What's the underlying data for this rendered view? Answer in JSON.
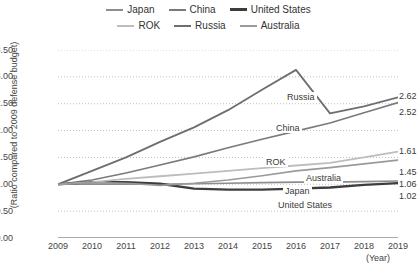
{
  "chart_data": {
    "type": "line",
    "title": "",
    "xlabel": "(Year)",
    "ylabel": "(Ratio compared to 2009 defense budget)",
    "x": [
      2009,
      2010,
      2011,
      2012,
      2013,
      2014,
      2015,
      2016,
      2017,
      2018,
      2019
    ],
    "xtick_labels": [
      "2009",
      "2010",
      "2011",
      "2012",
      "2013",
      "2014",
      "2015",
      "2016",
      "2017",
      "2018",
      "2019"
    ],
    "ytick_labels": [
      "0.00",
      "0.50",
      "1.00",
      "1.50",
      "2.00",
      "2.50",
      "3.00",
      "3.50"
    ],
    "ytick_values": [
      0.0,
      0.5,
      1.0,
      1.5,
      2.0,
      2.5,
      3.0,
      3.5
    ],
    "ylim": [
      0.0,
      3.5
    ],
    "grid": "horizontal-dotted",
    "legend_position": "top-center",
    "series": [
      {
        "name": "Japan",
        "color": "#8d8d8d",
        "width": 1.6,
        "values": [
          1.0,
          1.0,
          1.0,
          1.0,
          1.01,
          1.02,
          1.03,
          1.04,
          1.04,
          1.05,
          1.06
        ],
        "end_label": "1.06",
        "inline_label": "Japan"
      },
      {
        "name": "China",
        "color": "#7a7a7a",
        "width": 1.6,
        "values": [
          1.0,
          1.08,
          1.21,
          1.36,
          1.51,
          1.68,
          1.84,
          1.99,
          2.14,
          2.33,
          2.52
        ],
        "end_label": "2.52",
        "inline_label": "China"
      },
      {
        "name": "United States",
        "color": "#3d3d3d",
        "width": 2.3,
        "values": [
          1.0,
          1.04,
          1.04,
          1.01,
          0.92,
          0.9,
          0.9,
          0.92,
          0.94,
          0.99,
          1.02
        ],
        "end_label": "1.02",
        "inline_label": "United States"
      },
      {
        "name": "ROK",
        "color": "#bdbdbd",
        "width": 1.8,
        "values": [
          1.0,
          1.04,
          1.1,
          1.15,
          1.2,
          1.25,
          1.3,
          1.35,
          1.4,
          1.5,
          1.61
        ],
        "end_label": "1.61",
        "inline_label": "ROK"
      },
      {
        "name": "Russia",
        "color": "#6e6e6e",
        "width": 1.8,
        "values": [
          1.0,
          1.25,
          1.5,
          1.79,
          2.06,
          2.38,
          2.76,
          3.13,
          2.32,
          2.45,
          2.62
        ],
        "end_label": "2.62",
        "inline_label": "Russia"
      },
      {
        "name": "Australia",
        "color": "#9a9a9a",
        "width": 1.6,
        "values": [
          1.0,
          1.03,
          1.02,
          0.98,
          1.02,
          1.08,
          1.16,
          1.25,
          1.31,
          1.38,
          1.45
        ],
        "end_label": "1.45",
        "inline_label": "Australia"
      }
    ],
    "inline_annotations": [
      {
        "text": "Russia",
        "x_px": 285,
        "y_px": 92
      },
      {
        "text": "China",
        "x_px": 274,
        "y_px": 123
      },
      {
        "text": "ROK",
        "x_px": 264,
        "y_px": 157
      },
      {
        "text": "Australia",
        "x_px": 304,
        "y_px": 173
      },
      {
        "text": "Japan",
        "x_px": 283,
        "y_px": 186
      },
      {
        "text": "United States",
        "x_px": 276,
        "y_px": 200
      }
    ],
    "end_labels": [
      {
        "text": "2.62",
        "y_px": 91
      },
      {
        "text": "2.52",
        "y_px": 107
      },
      {
        "text": "1.61",
        "y_px": 146
      },
      {
        "text": "1.45",
        "y_px": 167
      },
      {
        "text": "1.06",
        "y_px": 179
      },
      {
        "text": "1.02",
        "y_px": 191
      }
    ]
  },
  "legend": {
    "rows": [
      [
        {
          "label": "Japan",
          "color": "#8d8d8d",
          "width": 2
        },
        {
          "label": "China",
          "color": "#7a7a7a",
          "width": 2
        },
        {
          "label": "United States",
          "color": "#3d3d3d",
          "width": 3
        }
      ],
      [
        {
          "label": "ROK",
          "color": "#bdbdbd",
          "width": 2
        },
        {
          "label": "Russia",
          "color": "#6e6e6e",
          "width": 2
        },
        {
          "label": "Australia",
          "color": "#9a9a9a",
          "width": 2
        }
      ]
    ]
  },
  "axes": {
    "y_title": "(Ratio compared to 2009 defense budget)",
    "x_unit": "(Year)"
  }
}
